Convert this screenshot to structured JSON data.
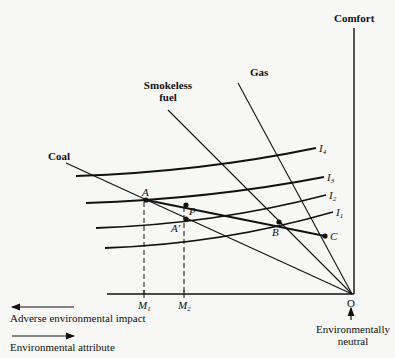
{
  "diagram": {
    "axes": {
      "vertical_label": "Comfort",
      "origin_label": "O",
      "origin_note_line1": "Environmentally",
      "origin_note_line2": "neutral"
    },
    "rays": [
      {
        "label": "Coal"
      },
      {
        "label_line1": "Smokeless",
        "label_line2": "fuel"
      },
      {
        "label": "Gas"
      }
    ],
    "indifference_curves": [
      {
        "base": "I",
        "sub": "4"
      },
      {
        "base": "I",
        "sub": "3"
      },
      {
        "base": "I",
        "sub": "2"
      },
      {
        "base": "I",
        "sub": "1"
      }
    ],
    "points": {
      "A": "A",
      "P": "P",
      "A_prime": "A′",
      "B": "B",
      "C": "C"
    },
    "axis_marks": [
      {
        "base": "M",
        "sub": "1"
      },
      {
        "base": "M",
        "sub": "2"
      }
    ],
    "legend": {
      "adverse": "Adverse environmental impact",
      "attribute": "Environmental attribute"
    },
    "colors": {
      "ink": "#111111",
      "paper": "#f7f7f5"
    }
  }
}
